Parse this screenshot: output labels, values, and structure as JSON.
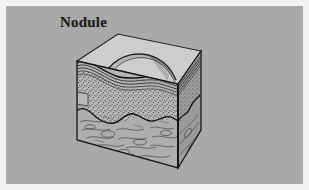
{
  "figure": {
    "label": "Nodule",
    "caption_text": "Nodule",
    "background_color": "#a9a9a9",
    "margin_color": "#f2f2f2",
    "ink_color": "#1d1d1d"
  },
  "block": {
    "top_face": {
      "name": "skin-surface",
      "fill": "#c9c9c9",
      "description": "epidermal surface with raised nodule dome"
    },
    "front_face": {
      "name": "front-cut-face",
      "fill": "#b4b4b4"
    },
    "right_face": {
      "name": "right-cut-face",
      "fill": "#9a9a9a"
    }
  },
  "layers": [
    {
      "id": "epidermis",
      "label": "epidermis",
      "texture": "parallel-thin-lines",
      "fill": "#c4c4c4",
      "order": 1
    },
    {
      "id": "dermis",
      "label": "dermis",
      "texture": "stipple-dots",
      "fill": "#b6b6b6",
      "order": 2
    },
    {
      "id": "subcutaneous",
      "label": "subcutaneous-fat",
      "texture": "wavy-fibers",
      "fill": "#aeaeae",
      "order": 3
    }
  ],
  "lesion": {
    "id": "nodule",
    "label": "Nodule",
    "shape": "raised-dome",
    "depth": "extends-into-dermis"
  }
}
